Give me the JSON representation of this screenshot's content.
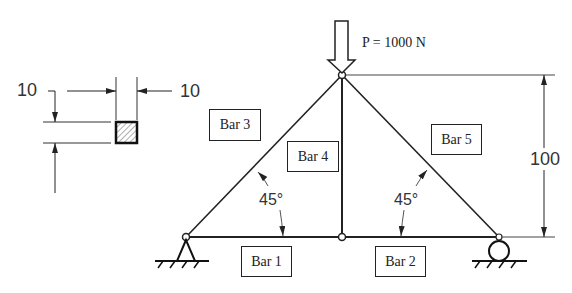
{
  "diagram": {
    "type": "truss",
    "load": {
      "label": "P = 1000 N",
      "direction": "down",
      "node": "top"
    },
    "bars": [
      {
        "id": "bar1",
        "label": "Bar 1",
        "from": "left-support",
        "to": "bottom-middle"
      },
      {
        "id": "bar2",
        "label": "Bar 2",
        "from": "bottom-middle",
        "to": "right-support"
      },
      {
        "id": "bar3",
        "label": "Bar 3",
        "from": "left-support",
        "to": "top"
      },
      {
        "id": "bar4",
        "label": "Bar 4",
        "from": "bottom-middle",
        "to": "top"
      },
      {
        "id": "bar5",
        "label": "Bar 5",
        "from": "top",
        "to": "right-support"
      }
    ],
    "angles": [
      {
        "label": "45°",
        "location": "left"
      },
      {
        "label": "45°",
        "location": "right"
      }
    ],
    "height_dimension": {
      "label": "100"
    },
    "cross_section": {
      "shape": "square",
      "width_label": "10",
      "height_label": "10"
    },
    "supports": [
      {
        "type": "pin",
        "location": "left"
      },
      {
        "type": "roller",
        "location": "right"
      }
    ],
    "colors": {
      "line": "#222222",
      "dimension": "#333333",
      "background": "#ffffff"
    }
  }
}
